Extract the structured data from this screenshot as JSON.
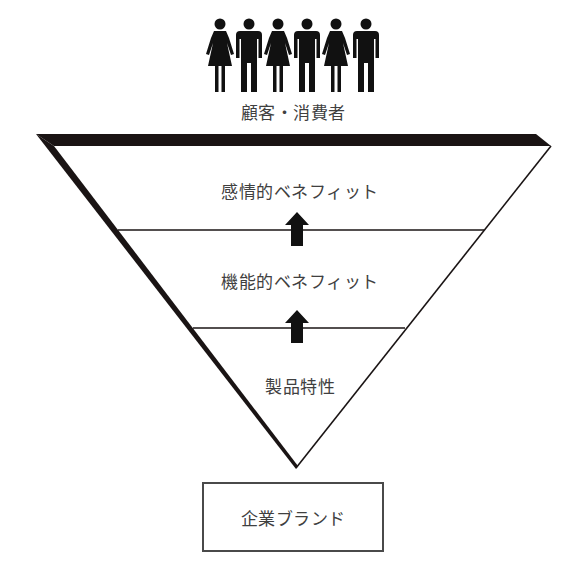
{
  "audience": {
    "label": "顧客・消費者",
    "figures": [
      "woman",
      "man",
      "woman",
      "man",
      "woman",
      "man"
    ]
  },
  "pyramid": {
    "shape": "inverted-triangle",
    "levels": [
      {
        "label": "感情的ベネフィット"
      },
      {
        "label": "機能的ベネフィット"
      },
      {
        "label": "製品特性"
      }
    ],
    "arrows": [
      "up",
      "up"
    ]
  },
  "foundation": {
    "label": "企業ブランド"
  },
  "colors": {
    "stroke": "#1a1414",
    "text": "#404040",
    "background": "#ffffff"
  }
}
